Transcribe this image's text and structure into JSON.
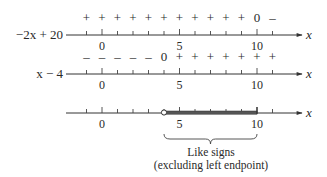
{
  "diagram": {
    "axis_variable": "x",
    "scale": {
      "x0_px": 102,
      "px_per_unit": 15.5,
      "min": -1,
      "max": 11
    },
    "tick_labels": [
      {
        "value": 0,
        "text": "0"
      },
      {
        "value": 5,
        "text": "5"
      },
      {
        "value": 10,
        "text": "10"
      }
    ],
    "lines": [
      {
        "id": "line-1",
        "expression": "−2x + 20",
        "axis_y": 35,
        "signs": [
          {
            "x": -1,
            "s": "+"
          },
          {
            "x": 0,
            "s": "+"
          },
          {
            "x": 1,
            "s": "+"
          },
          {
            "x": 2,
            "s": "+"
          },
          {
            "x": 3,
            "s": "+"
          },
          {
            "x": 4,
            "s": "+"
          },
          {
            "x": 5,
            "s": "+"
          },
          {
            "x": 6,
            "s": "+"
          },
          {
            "x": 7,
            "s": "+"
          },
          {
            "x": 8,
            "s": "+"
          },
          {
            "x": 9,
            "s": "+"
          },
          {
            "x": 10,
            "s": "0"
          },
          {
            "x": 11,
            "s": "–"
          }
        ]
      },
      {
        "id": "line-2",
        "expression": "x − 4",
        "axis_y": 74,
        "signs": [
          {
            "x": -1,
            "s": "–"
          },
          {
            "x": 0,
            "s": "–"
          },
          {
            "x": 1,
            "s": "–"
          },
          {
            "x": 2,
            "s": "–"
          },
          {
            "x": 3,
            "s": "–"
          },
          {
            "x": 4,
            "s": "0"
          },
          {
            "x": 5,
            "s": "+"
          },
          {
            "x": 6,
            "s": "+"
          },
          {
            "x": 7,
            "s": "+"
          },
          {
            "x": 8,
            "s": "+"
          },
          {
            "x": 9,
            "s": "+"
          },
          {
            "x": 10,
            "s": "+"
          },
          {
            "x": 11,
            "s": "+"
          }
        ]
      },
      {
        "id": "line-3",
        "expression": "",
        "axis_y": 113,
        "interval": {
          "from": 4,
          "to": 10,
          "open_left": true,
          "closed_right": true
        },
        "signs": []
      }
    ],
    "brace": {
      "from": 4,
      "to": 10
    },
    "caption": {
      "line1": "Like signs",
      "line2": "(excluding left endpoint)"
    }
  }
}
